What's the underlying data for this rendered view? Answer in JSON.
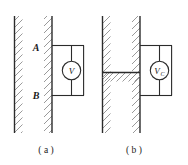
{
  "figure": {
    "background_color": "#ffffff",
    "line_color": "#2b2b2b",
    "hatch_color": "#8a8a8a",
    "panels": [
      {
        "id": "a",
        "caption": "( a )",
        "plate_labels": [
          {
            "id": "A",
            "text": "A"
          },
          {
            "id": "B",
            "text": "B"
          }
        ],
        "meter": {
          "id": "voltmeter-v",
          "label": "V",
          "subscript": "",
          "type": "voltmeter"
        },
        "dielectric_slab": false
      },
      {
        "id": "b",
        "caption": "( b )",
        "plate_labels": [],
        "meter": {
          "id": "voltmeter-vc",
          "label": "V",
          "subscript": "C",
          "type": "voltmeter"
        },
        "dielectric_slab": true
      }
    ]
  }
}
